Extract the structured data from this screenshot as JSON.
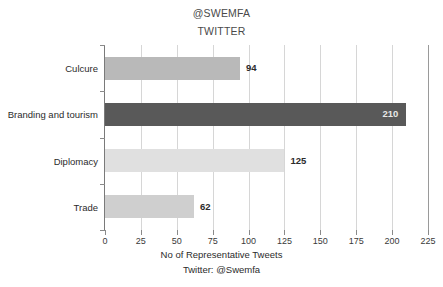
{
  "chart_data": {
    "type": "bar",
    "orientation": "horizontal",
    "title": "@SWEMFA",
    "subtitle": "TWITTER",
    "categories": [
      "Culcure",
      "Branding and tourism",
      "Diplomacy",
      "Trade"
    ],
    "values": [
      94,
      210,
      125,
      62
    ],
    "bar_colors": [
      "#b9b9b9",
      "#595959",
      "#e0e0e0",
      "#cfcfcf"
    ],
    "value_label_positions": [
      "outside",
      "inside",
      "outside",
      "outside"
    ],
    "xlabel": "No of Representative Tweets",
    "ylabel": "",
    "xlim": [
      0,
      225
    ],
    "xticks": [
      0,
      25,
      50,
      75,
      100,
      125,
      150,
      175,
      200,
      225
    ],
    "xtick_labels": [
      "0",
      "25",
      "50",
      "75",
      "100",
      "125",
      "150",
      "175",
      "200",
      "225"
    ],
    "grid": true,
    "grid_axis": "x",
    "legend": false,
    "source_note": "Twitter: @Swemfa"
  },
  "title_block": {
    "line1": "@SWEMFA",
    "line2": "TWITTER"
  },
  "footer": {
    "axis_title": "No of Representative Tweets",
    "source": "Twitter: @Swemfa"
  },
  "colors": {
    "background": "#ffffff",
    "text": "#2b2b2b",
    "gridline": "#d6d6d6",
    "axis": "#7a7a7a",
    "inside_label": "#e8e8e8"
  }
}
